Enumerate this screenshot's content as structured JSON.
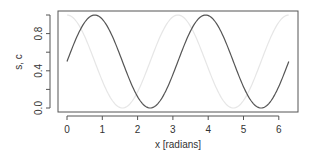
{
  "chart_data": {
    "type": "line",
    "title": "",
    "xlabel": "x [radians]",
    "ylabel": "s, c",
    "xlim": [
      0,
      6.283
    ],
    "ylim": [
      0,
      1
    ],
    "grid": false,
    "legend": null,
    "x_ticks": [
      0,
      1,
      2,
      3,
      4,
      5,
      6
    ],
    "x_tick_labels": [
      "0",
      "1",
      "2",
      "3",
      "4",
      "5",
      "6"
    ],
    "y_ticks": [
      0.0,
      0.2,
      0.4,
      0.6,
      0.8,
      1.0
    ],
    "y_tick_labels": [
      "0.0",
      "",
      "0.4",
      "",
      "0.8",
      ""
    ],
    "series": [
      {
        "name": "s",
        "formula": "(sin(2x)+1)/2",
        "color": "#555555",
        "x": [
          0,
          0.785,
          1.571,
          2.356,
          3.142,
          3.927,
          4.712,
          5.498,
          6.283
        ],
        "values": [
          0.5,
          1.0,
          0.5,
          0.0,
          0.5,
          1.0,
          0.5,
          0.0,
          0.5
        ]
      },
      {
        "name": "c",
        "formula": "(cos(2x)+1)/2",
        "color": "#e6e6e6",
        "x": [
          0,
          0.785,
          1.571,
          2.356,
          3.142,
          3.927,
          4.712,
          5.498,
          6.283
        ],
        "values": [
          1.0,
          0.5,
          0.0,
          0.5,
          1.0,
          0.5,
          0.0,
          0.5,
          1.0
        ]
      }
    ]
  }
}
